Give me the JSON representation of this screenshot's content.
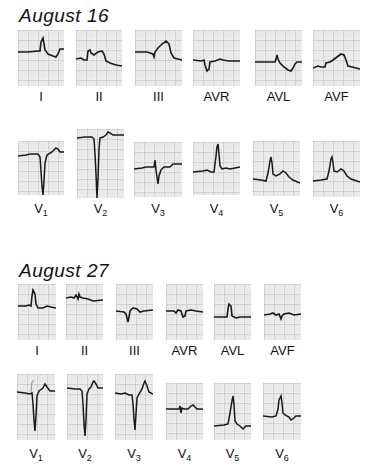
{
  "figure": {
    "type": "12-lead ECG comparison",
    "colors": {
      "background": "#ffffff",
      "grid_minor": "#d9d9d9",
      "grid_major": "#a8a8a8",
      "trace": "#1a1a1a",
      "paper": "#f4f4f4"
    }
  },
  "sections": [
    {
      "title": "August 16",
      "limb_leads": [
        {
          "lead": "I",
          "label": "I",
          "sub": ""
        },
        {
          "lead": "II",
          "label": "II",
          "sub": ""
        },
        {
          "lead": "III",
          "label": "III",
          "sub": ""
        },
        {
          "lead": "AVR",
          "label": "AVR",
          "sub": ""
        },
        {
          "lead": "AVL",
          "label": "AVL",
          "sub": ""
        },
        {
          "lead": "AVF",
          "label": "AVF",
          "sub": ""
        }
      ],
      "chest_leads": [
        {
          "lead": "V1",
          "label": "V",
          "sub": "1"
        },
        {
          "lead": "V2",
          "label": "V",
          "sub": "2"
        },
        {
          "lead": "V3",
          "label": "V",
          "sub": "3"
        },
        {
          "lead": "V4",
          "label": "V",
          "sub": "4"
        },
        {
          "lead": "V5",
          "label": "V",
          "sub": "5"
        },
        {
          "lead": "V6",
          "label": "V",
          "sub": "6"
        }
      ]
    },
    {
      "title": "August 27",
      "limb_leads": [
        {
          "lead": "I",
          "label": "I",
          "sub": ""
        },
        {
          "lead": "II",
          "label": "II",
          "sub": ""
        },
        {
          "lead": "III",
          "label": "III",
          "sub": ""
        },
        {
          "lead": "AVR",
          "label": "AVR",
          "sub": ""
        },
        {
          "lead": "AVL",
          "label": "AVL",
          "sub": ""
        },
        {
          "lead": "AVF",
          "label": "AVF",
          "sub": ""
        }
      ],
      "chest_leads": [
        {
          "lead": "V1",
          "label": "V",
          "sub": "1"
        },
        {
          "lead": "V2",
          "label": "V",
          "sub": "2"
        },
        {
          "lead": "V3",
          "label": "V",
          "sub": "3"
        },
        {
          "lead": "V4",
          "label": "V",
          "sub": "4"
        },
        {
          "lead": "V5",
          "label": "V",
          "sub": "5"
        },
        {
          "lead": "V6",
          "label": "V",
          "sub": "6"
        }
      ]
    }
  ]
}
